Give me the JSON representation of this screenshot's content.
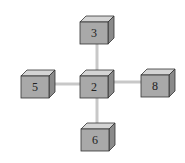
{
  "diagram": {
    "type": "node-neighbors",
    "center": {
      "id": "2",
      "label": "2"
    },
    "nodes": [
      {
        "id": "3",
        "label": "3",
        "position": "top"
      },
      {
        "id": "5",
        "label": "5",
        "position": "left"
      },
      {
        "id": "2",
        "label": "2",
        "position": "center"
      },
      {
        "id": "8",
        "label": "8",
        "position": "right"
      },
      {
        "id": "6",
        "label": "6",
        "position": "bottom"
      }
    ],
    "edges": [
      {
        "from": "2",
        "to": "3"
      },
      {
        "from": "2",
        "to": "5"
      },
      {
        "from": "2",
        "to": "8"
      },
      {
        "from": "2",
        "to": "6"
      }
    ],
    "colors": {
      "front": "#a9a9a9",
      "top": "#d4d4d4",
      "side": "#8a8a8a",
      "edge": "#c8c8c8",
      "outline": "#333333"
    }
  }
}
